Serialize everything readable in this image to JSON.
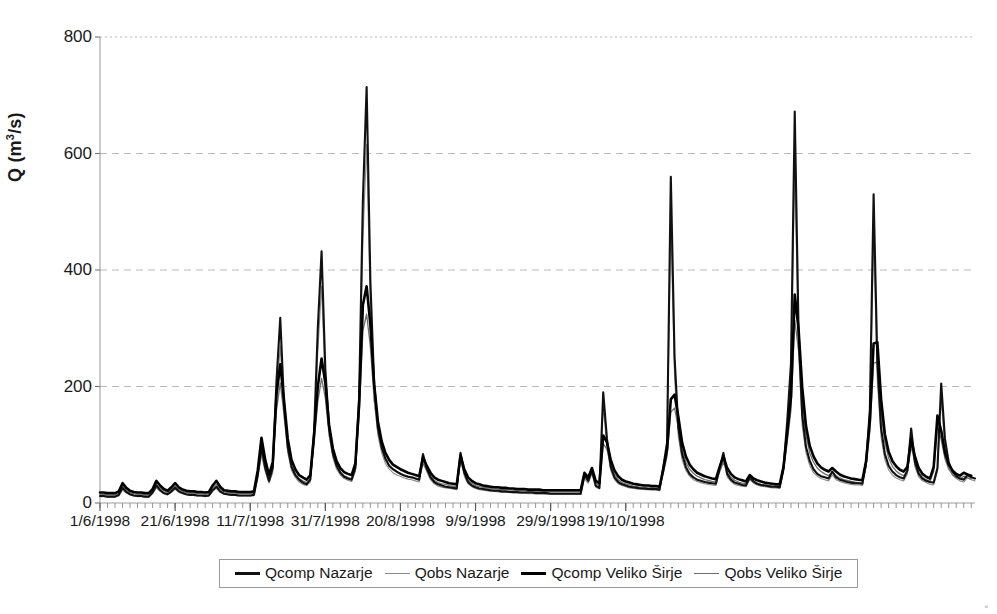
{
  "chart_data": {
    "type": "line",
    "title": "",
    "xlabel": "",
    "ylabel": "Q (m3/s)",
    "ylabel_html": "Q (m<sup>3</sup>/s)",
    "ylim": [
      0,
      800
    ],
    "yticks": [
      0,
      200,
      400,
      600,
      800
    ],
    "grid": "horizontal-dashed",
    "legend_position": "bottom-center",
    "x_axis_type": "date",
    "x_start": "1/6/1998",
    "x_end": "8/11/1998",
    "x_total_days": 161,
    "xticks": [
      "1/6/1998",
      "21/6/1998",
      "11/7/1998",
      "31/7/1998",
      "20/8/1998",
      "9/9/1998",
      "29/9/1998",
      "19/10/1998"
    ],
    "xtick_day_index": [
      0,
      20,
      40,
      60,
      80,
      100,
      120,
      140
    ],
    "minor_tick_interval_days": 2,
    "series": [
      {
        "name": "Qcomp Nazarje",
        "style": "solid",
        "color": "#111111",
        "width": 2.1,
        "values": [
          12,
          12,
          11,
          11,
          11,
          14,
          26,
          19,
          15,
          13,
          12,
          12,
          11,
          11,
          18,
          30,
          22,
          17,
          15,
          20,
          26,
          20,
          17,
          15,
          14,
          14,
          13,
          13,
          12,
          13,
          22,
          28,
          20,
          16,
          15,
          14,
          14,
          13,
          13,
          13,
          13,
          14,
          48,
          95,
          60,
          38,
          60,
          210,
          318,
          170,
          96,
          62,
          48,
          40,
          35,
          32,
          40,
          120,
          300,
          432,
          230,
          130,
          86,
          64,
          52,
          45,
          42,
          40,
          60,
          180,
          520,
          714,
          380,
          205,
          130,
          96,
          76,
          64,
          58,
          54,
          50,
          47,
          45,
          44,
          42,
          40,
          84,
          60,
          44,
          36,
          32,
          30,
          28,
          27,
          26,
          25,
          86,
          52,
          36,
          30,
          27,
          25,
          24,
          23,
          22,
          21,
          21,
          20,
          20,
          19,
          19,
          19,
          18,
          18,
          18,
          18,
          17,
          17,
          17,
          17,
          16,
          16,
          16,
          16,
          16,
          16,
          16,
          16,
          16,
          48,
          38,
          56,
          30,
          26,
          190,
          110,
          62,
          44,
          36,
          32,
          30,
          28,
          27,
          26,
          25,
          25,
          24,
          24,
          24,
          23,
          62,
          104,
          560,
          250,
          130,
          84,
          62,
          50,
          44,
          40,
          38,
          36,
          35,
          34,
          33,
          60,
          86,
          50,
          40,
          35,
          33,
          31,
          30,
          44,
          37,
          33,
          31,
          30,
          29,
          28,
          28,
          27,
          60,
          140,
          240,
          672,
          300,
          150,
          96,
          72,
          58,
          50,
          46,
          44,
          42,
          54,
          44,
          40,
          38,
          36,
          35,
          34,
          34,
          33,
          70,
          160,
          530,
          240,
          128,
          84,
          64,
          54,
          48,
          44,
          42,
          56,
          128,
          70,
          50,
          42,
          38,
          36,
          35,
          60,
          205,
          110,
          70,
          54,
          46,
          42,
          40,
          48,
          44,
          42
        ]
      },
      {
        "name": "Qobs Nazarje",
        "style": "solid-thin",
        "color": "#8c8c8c",
        "width": 1.1,
        "values": [
          11,
          11,
          10,
          10,
          10,
          12,
          22,
          17,
          14,
          12,
          11,
          11,
          10,
          10,
          16,
          26,
          20,
          16,
          14,
          18,
          24,
          18,
          16,
          14,
          13,
          13,
          12,
          12,
          11,
          12,
          20,
          25,
          18,
          15,
          14,
          13,
          13,
          12,
          12,
          12,
          12,
          13,
          42,
          82,
          54,
          34,
          52,
          180,
          270,
          150,
          86,
          56,
          44,
          36,
          32,
          30,
          36,
          104,
          260,
          372,
          200,
          116,
          78,
          58,
          48,
          42,
          39,
          37,
          54,
          156,
          450,
          616,
          330,
          180,
          116,
          86,
          68,
          58,
          52,
          48,
          46,
          43,
          41,
          40,
          38,
          36,
          74,
          54,
          40,
          33,
          29,
          27,
          26,
          25,
          24,
          23,
          76,
          46,
          33,
          28,
          25,
          23,
          22,
          21,
          20,
          20,
          19,
          18,
          18,
          18,
          17,
          17,
          17,
          17,
          16,
          16,
          16,
          16,
          16,
          15,
          15,
          15,
          15,
          15,
          15,
          15,
          15,
          15,
          15,
          42,
          34,
          50,
          27,
          24,
          166,
          96,
          56,
          40,
          33,
          30,
          28,
          26,
          25,
          24,
          24,
          23,
          23,
          22,
          22,
          21,
          54,
          90,
          484,
          216,
          114,
          74,
          56,
          46,
          40,
          37,
          35,
          33,
          32,
          31,
          30,
          54,
          76,
          45,
          37,
          32,
          30,
          29,
          28,
          40,
          34,
          31,
          29,
          28,
          27,
          26,
          26,
          25,
          54,
          124,
          210,
          580,
          262,
          132,
          86,
          64,
          52,
          46,
          42,
          40,
          38,
          48,
          40,
          37,
          35,
          33,
          32,
          31,
          31,
          30,
          62,
          140,
          460,
          208,
          112,
          74,
          57,
          48,
          43,
          40,
          38,
          50,
          112,
          62,
          45,
          38,
          35,
          32,
          31,
          54,
          178,
          96,
          62,
          48,
          42,
          38,
          36,
          43,
          40,
          38
        ]
      },
      {
        "name": "Qcomp Veliko Sirje",
        "style": "solid-thick",
        "color": "#000000",
        "width": 2.6,
        "values": [
          18,
          18,
          17,
          17,
          17,
          20,
          34,
          26,
          21,
          19,
          18,
          18,
          17,
          17,
          24,
          38,
          30,
          24,
          21,
          27,
          34,
          27,
          23,
          21,
          20,
          20,
          19,
          19,
          18,
          19,
          30,
          38,
          28,
          22,
          21,
          20,
          20,
          19,
          19,
          19,
          19,
          20,
          56,
          112,
          74,
          48,
          70,
          186,
          238,
          176,
          110,
          74,
          58,
          48,
          44,
          40,
          48,
          118,
          200,
          248,
          206,
          134,
          94,
          72,
          60,
          53,
          50,
          48,
          68,
          170,
          340,
          372,
          306,
          204,
          140,
          106,
          86,
          74,
          66,
          62,
          58,
          55,
          52,
          50,
          48,
          46,
          78,
          64,
          52,
          44,
          40,
          38,
          36,
          34,
          33,
          32,
          82,
          58,
          44,
          38,
          34,
          32,
          30,
          29,
          28,
          27,
          27,
          26,
          26,
          25,
          25,
          24,
          24,
          24,
          23,
          23,
          23,
          23,
          22,
          22,
          22,
          22,
          22,
          22,
          22,
          22,
          22,
          22,
          22,
          52,
          44,
          60,
          38,
          34,
          116,
          104,
          74,
          56,
          46,
          40,
          37,
          35,
          33,
          32,
          31,
          30,
          30,
          29,
          29,
          28,
          58,
          92,
          178,
          186,
          148,
          104,
          80,
          66,
          58,
          52,
          49,
          46,
          44,
          42,
          41,
          62,
          80,
          60,
          50,
          44,
          41,
          39,
          37,
          48,
          42,
          39,
          37,
          35,
          34,
          33,
          32,
          32,
          62,
          120,
          182,
          358,
          300,
          198,
          132,
          98,
          80,
          68,
          61,
          57,
          54,
          60,
          54,
          49,
          46,
          44,
          42,
          41,
          40,
          39,
          72,
          140,
          274,
          276,
          178,
          118,
          88,
          72,
          63,
          57,
          54,
          62,
          110,
          80,
          60,
          50,
          45,
          42,
          62,
          150,
          124,
          86,
          66,
          56,
          50,
          47,
          52,
          49,
          47
        ]
      },
      {
        "name": "Qobs Veliko Sirje",
        "style": "solid-thin2",
        "color": "#6f6f6f",
        "width": 1.3,
        "values": [
          15,
          15,
          14,
          14,
          14,
          17,
          29,
          22,
          18,
          16,
          15,
          15,
          14,
          14,
          20,
          32,
          26,
          21,
          18,
          23,
          29,
          23,
          20,
          18,
          17,
          17,
          16,
          16,
          15,
          16,
          26,
          32,
          24,
          19,
          18,
          17,
          17,
          16,
          16,
          16,
          16,
          17,
          48,
          96,
          64,
          42,
          60,
          160,
          206,
          152,
          96,
          64,
          50,
          42,
          38,
          35,
          42,
          102,
          174,
          214,
          180,
          118,
          82,
          63,
          53,
          47,
          44,
          42,
          60,
          148,
          296,
          324,
          268,
          178,
          122,
          93,
          76,
          65,
          58,
          54,
          51,
          48,
          46,
          44,
          42,
          40,
          68,
          56,
          46,
          39,
          35,
          33,
          32,
          30,
          29,
          28,
          72,
          51,
          39,
          34,
          30,
          28,
          27,
          26,
          25,
          24,
          24,
          23,
          23,
          22,
          22,
          21,
          21,
          21,
          20,
          20,
          20,
          20,
          20,
          19,
          19,
          19,
          19,
          19,
          19,
          19,
          19,
          19,
          19,
          46,
          39,
          53,
          34,
          30,
          102,
          92,
          65,
          49,
          40,
          35,
          33,
          31,
          29,
          28,
          27,
          27,
          26,
          26,
          25,
          25,
          51,
          81,
          156,
          163,
          130,
          91,
          70,
          58,
          51,
          46,
          43,
          40,
          39,
          37,
          36,
          54,
          70,
          53,
          44,
          39,
          36,
          34,
          33,
          42,
          37,
          34,
          32,
          31,
          30,
          29,
          28,
          28,
          54,
          105,
          160,
          314,
          263,
          174,
          116,
          86,
          70,
          60,
          54,
          50,
          47,
          53,
          47,
          43,
          40,
          39,
          37,
          36,
          35,
          34,
          63,
          123,
          240,
          242,
          156,
          104,
          77,
          63,
          55,
          50,
          47,
          54,
          97,
          70,
          53,
          44,
          40,
          37,
          54,
          132,
          109,
          76,
          58,
          49,
          44,
          41,
          46,
          43,
          41
        ]
      }
    ]
  },
  "axes": {
    "y_tick_labels": [
      "800",
      "600",
      "400",
      "200",
      "0"
    ],
    "x_tick_labels": [
      "1/6/1998",
      "21/6/1998",
      "11/7/1998",
      "31/7/1998",
      "20/8/1998",
      "9/9/1998",
      "29/9/1998",
      "19/10/1998"
    ]
  },
  "legend": {
    "items": [
      {
        "label": "Qcomp Nazarje",
        "swatch": "thick-black-line",
        "class": "lg-thick"
      },
      {
        "label": "Qobs Nazarje",
        "swatch": "thin-gray-line",
        "class": "lg-thin"
      },
      {
        "label": "Qcomp Veliko Širje",
        "swatch": "thick-black-line",
        "class": "lg-thick2"
      },
      {
        "label": "Qobs Veliko Širje",
        "swatch": "thin-gray-line",
        "class": "lg-thin2"
      }
    ]
  },
  "colors": {
    "plot_border": "#b0b0b0",
    "gridline": "#b8b8b8",
    "axis_text": "#1a1a1a",
    "background": "#ffffff"
  },
  "artifact": {
    "corner_mark": "⁌"
  }
}
